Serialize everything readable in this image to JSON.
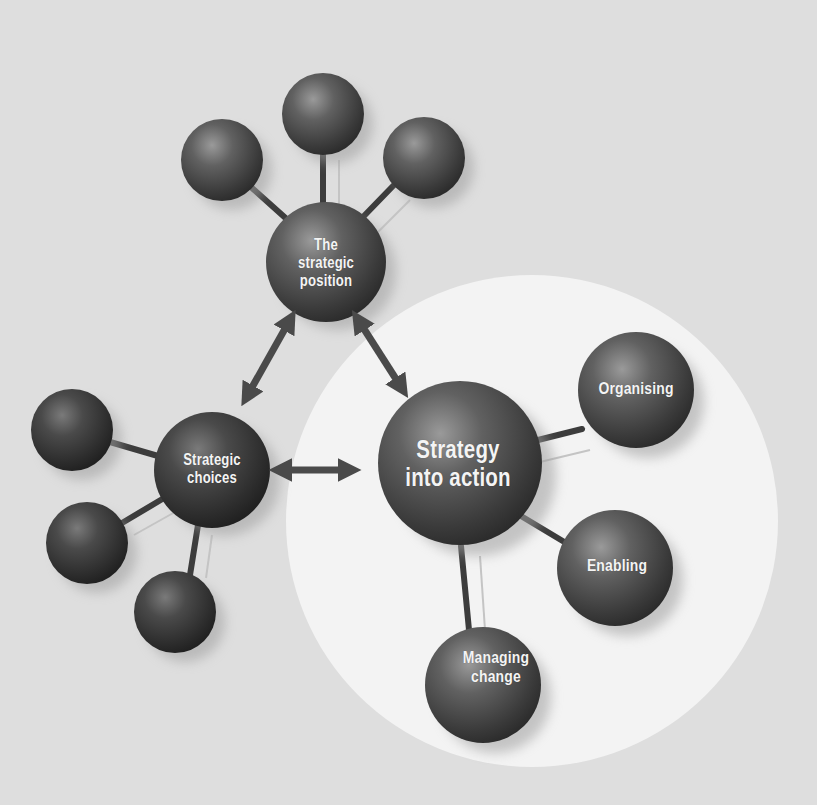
{
  "diagram": {
    "title": "",
    "colors": {
      "background": "#dedede",
      "highlight_circle": "#f3f3f3",
      "ball_dark": "#2e2e2e",
      "ball_mid": "#5a5a5a",
      "ball_highlight": "#9a9a9a",
      "connector": "#3c3c3c",
      "arrow": "#4a4a4a",
      "label_text": "#f4f4f4"
    },
    "nodes": {
      "strategic_position": {
        "label": "The\nstrategic\nposition"
      },
      "strategic_choices": {
        "label": "Strategic\nchoices"
      },
      "strategy_into_action": {
        "label": "Strategy\ninto action"
      },
      "organising": {
        "label": "Organising"
      },
      "enabling": {
        "label": "Enabling"
      },
      "managing_change": {
        "label": "Managing\nchange"
      }
    },
    "unlabeled_satellites": {
      "strategic_position": 3,
      "strategic_choices": 3
    },
    "arrows": [
      {
        "from": "strategic_position",
        "to": "strategic_choices",
        "type": "double-headed"
      },
      {
        "from": "strategic_position",
        "to": "strategy_into_action",
        "type": "double-headed"
      },
      {
        "from": "strategic_choices",
        "to": "strategy_into_action",
        "type": "double-headed"
      }
    ],
    "highlighted_cluster": "strategy_into_action"
  }
}
